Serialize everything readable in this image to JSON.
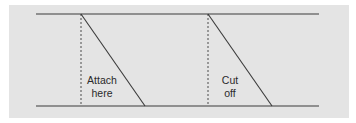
{
  "diagram": {
    "panel": {
      "x": 9,
      "y": 5,
      "width": 340,
      "height": 113,
      "color": "#e4e4e4"
    },
    "line_color": "#3a3a3a",
    "rails": {
      "top": {
        "x1": 36,
        "x2": 319,
        "y": 14
      },
      "bottom": {
        "x1": 36,
        "x2": 319,
        "y": 106
      }
    },
    "cuts": [
      {
        "id": "attach",
        "dashed_x": 81,
        "diagonal": {
          "x1": 81,
          "y1": 14,
          "x2": 145,
          "y2": 106
        },
        "label_lines": [
          "Attach",
          "here"
        ],
        "label_x": 102,
        "label_y": [
          84,
          97
        ]
      },
      {
        "id": "cut-off",
        "dashed_x": 208,
        "diagonal": {
          "x1": 208,
          "y1": 14,
          "x2": 272,
          "y2": 106
        },
        "label_lines": [
          "Cut",
          "off"
        ],
        "label_x": 230,
        "label_y": [
          84,
          97
        ]
      }
    ]
  }
}
